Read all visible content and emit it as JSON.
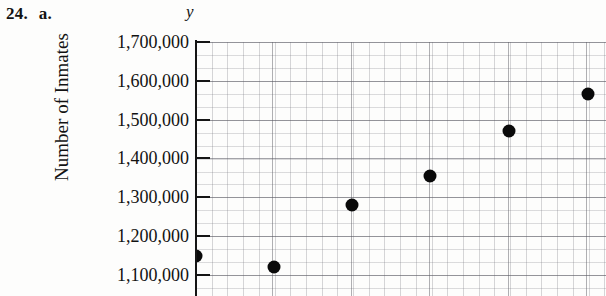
{
  "exercise": {
    "number": "24.",
    "part": "a."
  },
  "axis": {
    "y_variable": "y",
    "y_title": "Number of Inmates",
    "y_tick_labels": [
      "1,700,000",
      "1,600,000",
      "1,500,000",
      "1,400,000",
      "1,300,000",
      "1,200,000",
      "1,100,000"
    ]
  },
  "colors": {
    "ink": "#0a0a0a",
    "grid_major": "#5a5a62",
    "grid_minor": "#78788022",
    "paper": "#fdfdfc"
  },
  "chart_data": {
    "type": "scatter",
    "title": "",
    "xlabel": "",
    "ylabel": "Number of Inmates",
    "ylim": [
      1100000,
      1700000
    ],
    "yticks": [
      1100000,
      1200000,
      1300000,
      1400000,
      1500000,
      1600000,
      1700000
    ],
    "ytick_labels": [
      "1,100,000",
      "1,200,000",
      "1,300,000",
      "1,400,000",
      "1,500,000",
      "1,600,000",
      "1,700,000"
    ],
    "grid": true,
    "grid_minor": true,
    "legend": "none",
    "series": [
      {
        "name": "Number of Inmates",
        "marker": "filled-circle",
        "color": "#0a0a0a",
        "points": [
          {
            "px": 0,
            "y": 1150000
          },
          {
            "px": 78,
            "y": 1120000
          },
          {
            "px": 156,
            "y": 1280000
          },
          {
            "px": 234,
            "y": 1355000
          },
          {
            "px": 313,
            "y": 1470000
          },
          {
            "px": 392,
            "y": 1565000
          }
        ],
        "values": [
          1150000,
          1120000,
          1280000,
          1355000,
          1470000,
          1565000
        ]
      }
    ]
  }
}
